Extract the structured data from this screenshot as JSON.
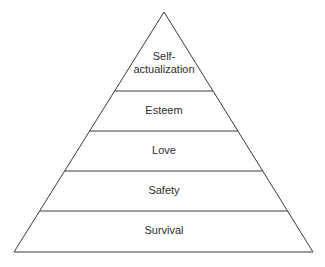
{
  "diagram": {
    "type": "pyramid",
    "title": "",
    "levels_top_to_bottom": [
      {
        "id": "self-actualization",
        "label_lines": [
          "Self-",
          "actualization"
        ]
      },
      {
        "id": "esteem",
        "label_lines": [
          "Esteem"
        ]
      },
      {
        "id": "love",
        "label_lines": [
          "Love"
        ]
      },
      {
        "id": "safety",
        "label_lines": [
          "Safety"
        ]
      },
      {
        "id": "survival",
        "label_lines": [
          "Survival"
        ]
      }
    ],
    "colors": {
      "stroke": "#3a3a3a",
      "text": "#2e2e2e",
      "fill": "#ffffff"
    }
  }
}
